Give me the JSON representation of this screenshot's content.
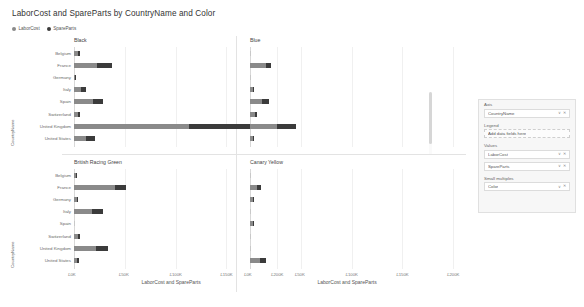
{
  "header": {
    "title": "LaborCost and SpareParts by CountryName and Color"
  },
  "legend": {
    "items": [
      {
        "label": "LaborCost",
        "color": "#8a8a8a",
        "icon": "legend-dot"
      },
      {
        "label": "SpareParts",
        "color": "#3b3b3b",
        "icon": "legend-dot"
      }
    ]
  },
  "fields_pane": {
    "sections": [
      {
        "name": "Axis",
        "label": "Axis",
        "wells": [
          {
            "label": "CountryName",
            "placeholder": false
          }
        ]
      },
      {
        "name": "Legend",
        "label": "Legend",
        "wells": [
          {
            "label": "Add data fields here",
            "placeholder": true
          }
        ]
      },
      {
        "name": "Values",
        "label": "Values",
        "wells": [
          {
            "label": "LaborCost",
            "placeholder": false
          },
          {
            "label": "SpareParts",
            "placeholder": false
          }
        ]
      },
      {
        "name": "Small multiples",
        "label": "Small multiples",
        "wells": [
          {
            "label": "Color",
            "placeholder": false
          }
        ]
      }
    ],
    "caret_glyph": "∨",
    "close_glyph": "✕"
  },
  "chart_data": {
    "type": "bar",
    "title": "LaborCost and SpareParts by CountryName and Color",
    "subtype": "stacked-horizontal-small-multiples",
    "xlabel": "LaborCost and SpareParts",
    "ylabel": "CountryName",
    "xlim": [
      0,
      200000
    ],
    "xticks": [
      0,
      50000,
      100000,
      150000,
      200000
    ],
    "xticklabels": [
      "£0K",
      "£50K",
      "£100K",
      "£150K",
      "£200K"
    ],
    "grid": true,
    "legend_position": "top-left",
    "categories": [
      "Belgium",
      "France",
      "Germany",
      "Italy",
      "Spain",
      "Switzerland",
      "United Kingdom",
      "United States"
    ],
    "series_names": [
      "LaborCost",
      "SpareParts"
    ],
    "series_colors": [
      "#8a8a8a",
      "#3b3b3b"
    ],
    "panels": [
      {
        "title": "Black",
        "series": [
          {
            "name": "LaborCost",
            "values": [
              3800,
              23000,
              900,
              6500,
              19000,
              4200,
              113000,
              12000
            ]
          },
          {
            "name": "SpareParts",
            "values": [
              2600,
              14500,
              300,
              5200,
              9500,
              1600,
              62000,
              8500
            ]
          }
        ]
      },
      {
        "title": "Blue",
        "series": [
          {
            "name": "LaborCost",
            "values": [
              0,
              15500,
              0,
              3000,
              11500,
              4500,
              27000,
              2600
            ]
          },
          {
            "name": "SpareParts",
            "values": [
              0,
              5500,
              0,
              1200,
              7000,
              2300,
              18500,
              1800
            ]
          }
        ]
      },
      {
        "title": "British Racing Green",
        "series": [
          {
            "name": "LaborCost",
            "values": [
              2400,
              40000,
              3000,
              17500,
              0,
              4000,
              22000,
              3000
            ]
          },
          {
            "name": "SpareParts",
            "values": [
              900,
              11000,
              1200,
              11000,
              0,
              1800,
              11500,
              1600
            ]
          }
        ]
      },
      {
        "title": "Canary Yellow",
        "series": [
          {
            "name": "LaborCost",
            "values": [
              0,
              6500,
              3000,
              0,
              2500,
              0,
              0,
              9500
            ]
          },
          {
            "name": "SpareParts",
            "values": [
              0,
              4500,
              1200,
              0,
              600,
              0,
              0,
              6500
            ]
          }
        ]
      }
    ]
  }
}
